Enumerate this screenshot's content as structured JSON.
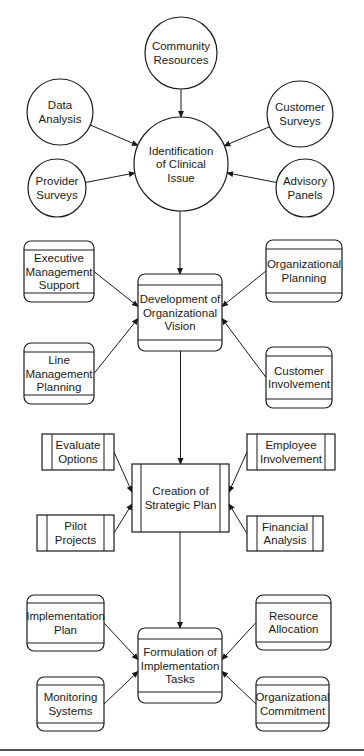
{
  "diagram": {
    "type": "flowchart",
    "tiers": [
      {
        "name": "identification",
        "shape": "circle",
        "center": {
          "id": "n0",
          "lines": [
            "Identification",
            "of Clinical",
            "Issue"
          ],
          "cx": 181,
          "cy": 164,
          "r": 47
        },
        "inputs": [
          {
            "id": "n1",
            "lines": [
              "Community",
              "Resources"
            ],
            "cx": 181,
            "cy": 53,
            "r": 36
          },
          {
            "id": "n2",
            "lines": [
              "Data",
              "Analysis"
            ],
            "cx": 60,
            "cy": 112,
            "r": 33
          },
          {
            "id": "n3",
            "lines": [
              "Customer",
              "Surveys"
            ],
            "cx": 300,
            "cy": 114,
            "r": 33
          },
          {
            "id": "n4",
            "lines": [
              "Provider",
              "Surveys"
            ],
            "cx": 57,
            "cy": 188,
            "r": 29
          },
          {
            "id": "n5",
            "lines": [
              "Advisory",
              "Panels"
            ],
            "cx": 305,
            "cy": 188,
            "r": 29
          }
        ]
      },
      {
        "name": "vision",
        "shape": "banded-rounded-rect",
        "center": {
          "id": "n6",
          "lines": [
            "Development of",
            "Organizational",
            "Vision"
          ],
          "x": 138,
          "y": 274,
          "w": 84,
          "h": 77
        },
        "inputs": [
          {
            "id": "n7",
            "lines": [
              "Executive",
              "Management",
              "Support"
            ],
            "x": 24,
            "y": 241,
            "w": 70,
            "h": 61
          },
          {
            "id": "n8",
            "lines": [
              "Organizational",
              "Planning"
            ],
            "x": 266,
            "y": 240,
            "w": 76,
            "h": 62
          },
          {
            "id": "n9",
            "lines": [
              "Line",
              "Management",
              "Planning"
            ],
            "x": 24,
            "y": 343,
            "w": 70,
            "h": 61
          },
          {
            "id": "n10",
            "lines": [
              "Customer",
              "Involvement"
            ],
            "x": 266,
            "y": 347,
            "w": 66,
            "h": 61
          }
        ]
      },
      {
        "name": "strategic-plan",
        "shape": "predefined-process",
        "center": {
          "id": "n11",
          "lines": [
            "Creation of",
            "Strategic Plan"
          ],
          "x": 132,
          "y": 464,
          "w": 97,
          "h": 68
        },
        "inputs": [
          {
            "id": "n12",
            "lines": [
              "Evaluate",
              "Options"
            ],
            "x": 42,
            "y": 434,
            "w": 72,
            "h": 36
          },
          {
            "id": "n13",
            "lines": [
              "Employee",
              "Involvement"
            ],
            "x": 247,
            "y": 434,
            "w": 88,
            "h": 36
          },
          {
            "id": "n14",
            "lines": [
              "Pilot",
              "Projects"
            ],
            "x": 37,
            "y": 515,
            "w": 77,
            "h": 36
          },
          {
            "id": "n15",
            "lines": [
              "Financial",
              "Analysis"
            ],
            "x": 247,
            "y": 516,
            "w": 76,
            "h": 35
          }
        ]
      },
      {
        "name": "implementation",
        "shape": "banded-rounded-rect",
        "center": {
          "id": "n16",
          "lines": [
            "Formulation of",
            "Implementation",
            "Tasks"
          ],
          "x": 138,
          "y": 628,
          "w": 84,
          "h": 75
        },
        "inputs": [
          {
            "id": "n17",
            "lines": [
              "Implementation",
              "Plan"
            ],
            "x": 27,
            "y": 595,
            "w": 77,
            "h": 56
          },
          {
            "id": "n18",
            "lines": [
              "Resource",
              "Allocation"
            ],
            "x": 256,
            "y": 595,
            "w": 75,
            "h": 55
          },
          {
            "id": "n19",
            "lines": [
              "Monitoring",
              "Systems"
            ],
            "x": 37,
            "y": 677,
            "w": 67,
            "h": 54
          },
          {
            "id": "n20",
            "lines": [
              "Organizational",
              "Commitment"
            ],
            "x": 256,
            "y": 677,
            "w": 73,
            "h": 54
          }
        ]
      }
    ],
    "flow": [
      {
        "from": "n1",
        "to": "n0"
      },
      {
        "from": "n2",
        "to": "n0"
      },
      {
        "from": "n3",
        "to": "n0"
      },
      {
        "from": "n4",
        "to": "n0"
      },
      {
        "from": "n5",
        "to": "n0"
      },
      {
        "from": "n0",
        "to": "n6"
      },
      {
        "from": "n7",
        "to": "n6"
      },
      {
        "from": "n8",
        "to": "n6"
      },
      {
        "from": "n9",
        "to": "n6"
      },
      {
        "from": "n10",
        "to": "n6"
      },
      {
        "from": "n6",
        "to": "n11"
      },
      {
        "from": "n12",
        "to": "n11"
      },
      {
        "from": "n13",
        "to": "n11"
      },
      {
        "from": "n14",
        "to": "n11"
      },
      {
        "from": "n15",
        "to": "n11"
      },
      {
        "from": "n11",
        "to": "n16"
      },
      {
        "from": "n17",
        "to": "n16"
      },
      {
        "from": "n18",
        "to": "n16"
      },
      {
        "from": "n19",
        "to": "n16"
      },
      {
        "from": "n20",
        "to": "n16"
      }
    ],
    "colors": {
      "stroke": "#1a1a1a",
      "background": "#ffffff",
      "rule": "#555555"
    }
  }
}
